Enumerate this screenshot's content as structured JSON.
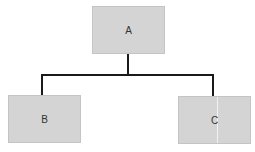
{
  "diagram": {
    "type": "tree",
    "nodes": [
      {
        "id": "A",
        "label": "A"
      },
      {
        "id": "B",
        "label": "B"
      },
      {
        "id": "C",
        "label": "C"
      }
    ],
    "edges": [
      {
        "from": "A",
        "to": "B"
      },
      {
        "from": "A",
        "to": "C"
      }
    ],
    "colors": {
      "node_fill": "#d4d4d4",
      "edge": "#1a1a1a"
    }
  }
}
